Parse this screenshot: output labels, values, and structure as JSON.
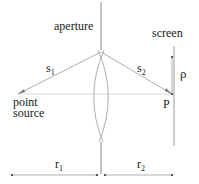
{
  "diagram": {
    "labels": {
      "aperture": "aperture",
      "screen": "screen",
      "s1_main": "s",
      "s1_sub": "1",
      "s2_main": "s",
      "s2_sub": "2",
      "rho": "ρ",
      "point_line1": "point",
      "point_line2": "source",
      "P": "P",
      "r1_main": "r",
      "r1_sub": "1",
      "r2_main": "r",
      "r2_sub": "2"
    },
    "colors": {
      "line": "#9a9a9a",
      "axis": "#c8c8c8",
      "text": "#222222"
    }
  }
}
